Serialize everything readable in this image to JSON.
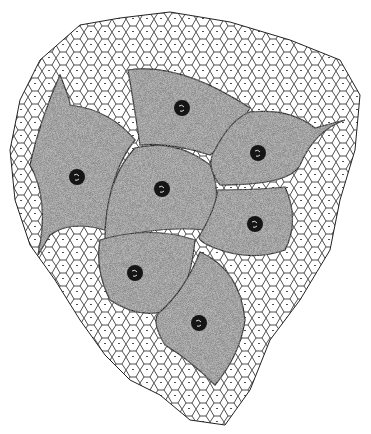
{
  "figure": {
    "background_color": "#ffffff",
    "ink_color": "#1a1a1a",
    "stipple_color": "#7a7a7a",
    "large_cells": [
      {
        "id": "top",
        "nucleus": [
          182,
          108
        ]
      },
      {
        "id": "left",
        "nucleus": [
          77,
          177
        ]
      },
      {
        "id": "center",
        "nucleus": [
          162,
          189
        ]
      },
      {
        "id": "upper-right",
        "nucleus": [
          258,
          153
        ]
      },
      {
        "id": "right",
        "nucleus": [
          255,
          224
        ]
      },
      {
        "id": "lower-left",
        "nucleus": [
          135,
          273
        ]
      },
      {
        "id": "bottom",
        "nucleus": [
          199,
          323
        ]
      }
    ]
  }
}
